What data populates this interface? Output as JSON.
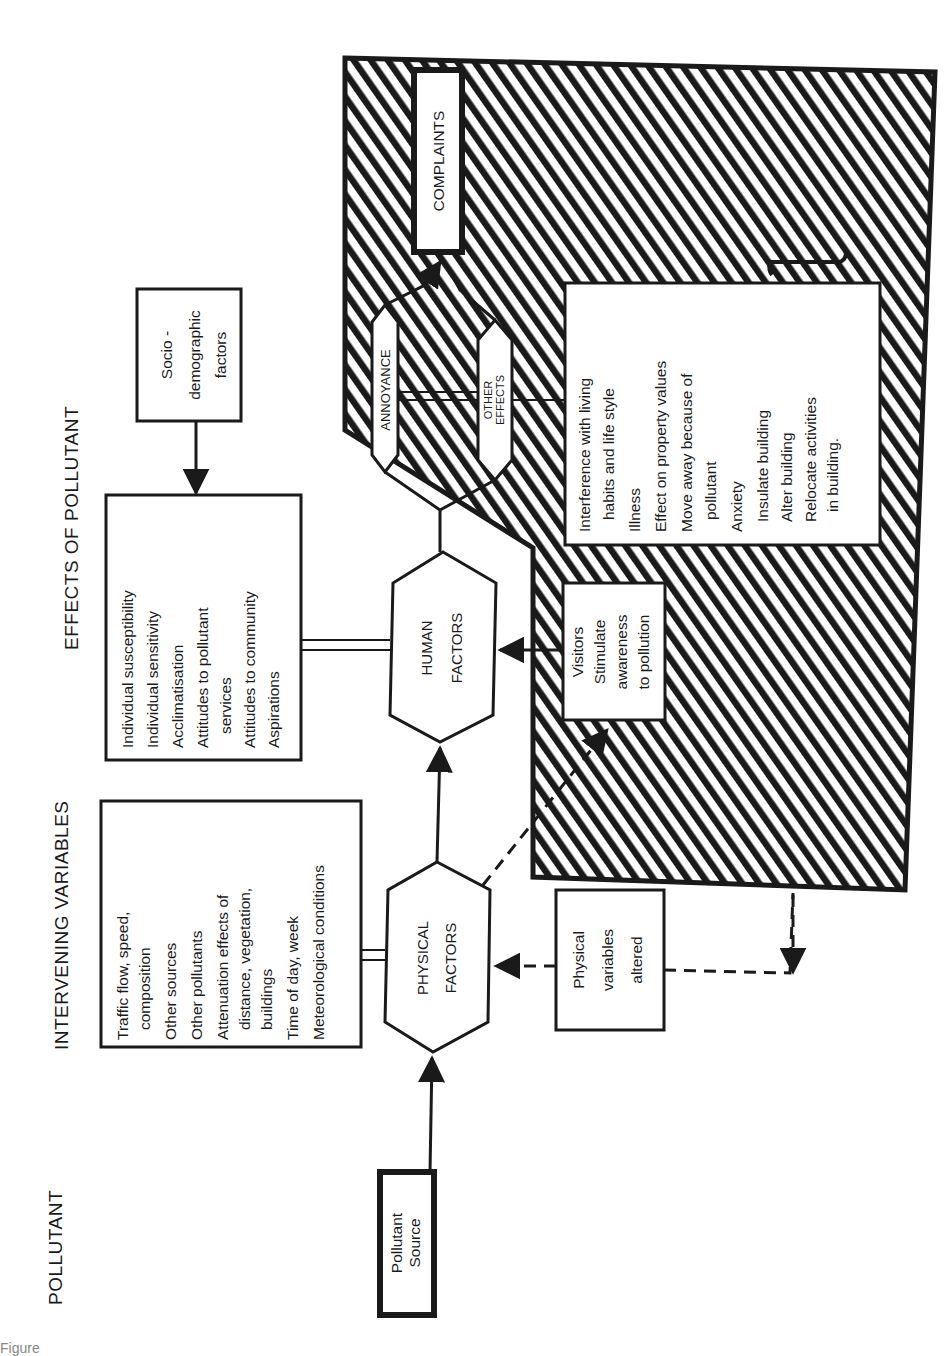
{
  "orientation": "rotated-90-ccw",
  "column_headers": {
    "pollutant": "POLLUTANT",
    "intervening": "INTERVENING VARIABLES",
    "effects": "EFFECTS OF POLLUTANT"
  },
  "nodes": {
    "pollutant_source": {
      "line1": "Pollutant",
      "line2": "Source"
    },
    "physical_factors": {
      "line1": "PHYSICAL",
      "line2": "FACTORS"
    },
    "human_factors": {
      "line1": "HUMAN",
      "line2": "FACTORS"
    },
    "annoyance": {
      "label": "ANNOYANCE"
    },
    "other_effects": {
      "line1": "OTHER",
      "line2": "EFFECTS"
    },
    "complaints": {
      "label": "COMPLAINTS"
    },
    "physical_variables_altered": {
      "line1": "Physical",
      "line2": "variables",
      "line3": "altered"
    },
    "visitors": {
      "line1": "Visitors",
      "line2": "Stimulate",
      "line3": "awareness",
      "line4": "to pollution"
    },
    "socio_demographic": {
      "line1": "Socio -",
      "line2": "demographic",
      "line3": "factors"
    }
  },
  "lists": {
    "physical_variables": [
      "Traffic flow, speed,",
      "  composition",
      "Other sources",
      "Other pollutants",
      "Attenuation effects of",
      "  distance, vegetation,",
      "  buildings",
      "Time of day, week",
      "Meteorological conditions"
    ],
    "human_variables": [
      "Individual susceptibility",
      "Individual sensitivity",
      "Acclimatisation",
      "Attitudes to pollutant",
      "  services",
      "Attitudes to community",
      "Aspirations"
    ],
    "other_effects_list": [
      "Interference with living",
      "  habits and life style",
      "Illness",
      "Effect on property values",
      "Move away because of",
      "  pollutant",
      "Anxiety",
      "Insulate building",
      "Alter building",
      "Relocate activities",
      "  in building."
    ]
  },
  "caption": {
    "fragment": "Figure"
  },
  "colors": {
    "ink": "#1a1a1a",
    "paper": "#ffffff"
  }
}
